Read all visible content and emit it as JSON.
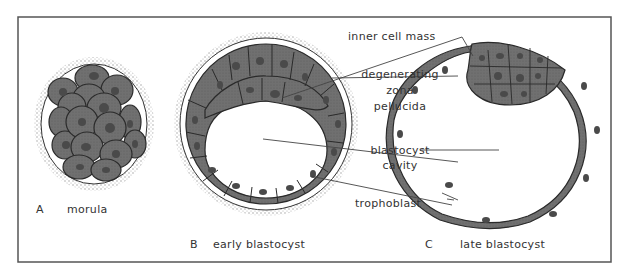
{
  "figure": {
    "panels": [
      {
        "letter": "A",
        "caption": "morula"
      },
      {
        "letter": "B",
        "caption": "early blastocyst"
      },
      {
        "letter": "C",
        "caption": "late blastocyst"
      }
    ],
    "labels": {
      "inner_cell_mass": "inner cell mass",
      "degenerating": "degenerating",
      "zona": "zona",
      "pellucida": "pellucida",
      "blastocyst": "blastocyst",
      "cavity": "cavity",
      "trophoblast": "trophoblast"
    },
    "colors": {
      "cell_fill": "#6e6e6e",
      "cell_outline": "#2a2a2a",
      "nucleus": "#4a4a4a",
      "zona_stipple": "#b5b5b5",
      "frame": "#555555",
      "text": "#333333"
    }
  }
}
